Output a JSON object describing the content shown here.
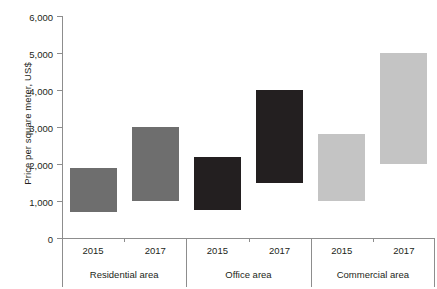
{
  "chart_data": {
    "type": "bar",
    "bar_style": "floating-range",
    "title": "",
    "subtitle": "",
    "xlabel": "",
    "ylabel": "Price per square meter, US$",
    "ylim": [
      0,
      6000
    ],
    "ytick_values": [
      0,
      1000,
      2000,
      3000,
      4000,
      5000,
      6000
    ],
    "ytick_labels": [
      "0",
      "1,000",
      "2,000",
      "3,000",
      "4,000",
      "5,000",
      "6,000"
    ],
    "grid": false,
    "legend": "none",
    "categories": [
      "2015",
      "2017"
    ],
    "groups": [
      {
        "name": "Residential area",
        "color": "#6e6e6e",
        "bars": [
          {
            "category": "2015",
            "low": 700,
            "high": 1900
          },
          {
            "category": "2017",
            "low": 1000,
            "high": 3000
          }
        ]
      },
      {
        "name": "Office area",
        "color": "#231f20",
        "bars": [
          {
            "category": "2015",
            "low": 750,
            "high": 2200
          },
          {
            "category": "2017",
            "low": 1500,
            "high": 4000
          }
        ]
      },
      {
        "name": "Commercial area",
        "color": "#c4c4c4",
        "bars": [
          {
            "category": "2015",
            "low": 1000,
            "high": 2800
          },
          {
            "category": "2017",
            "low": 2000,
            "high": 5000
          }
        ]
      }
    ]
  },
  "axis": {
    "y_title": "Price per square meter, US$",
    "ticks": [
      {
        "label": "6,000",
        "value": 6000
      },
      {
        "label": "5,000",
        "value": 5000
      },
      {
        "label": "4,000",
        "value": 4000
      },
      {
        "label": "3,000",
        "value": 3000
      },
      {
        "label": "2,000",
        "value": 2000
      },
      {
        "label": "1,000",
        "value": 1000
      },
      {
        "label": "0",
        "value": 0
      }
    ]
  },
  "category_axis": {
    "years": [
      "2015",
      "2017",
      "2015",
      "2017",
      "2015",
      "2017"
    ],
    "groups": [
      "Residential area",
      "Office area",
      "Commercial area"
    ]
  }
}
